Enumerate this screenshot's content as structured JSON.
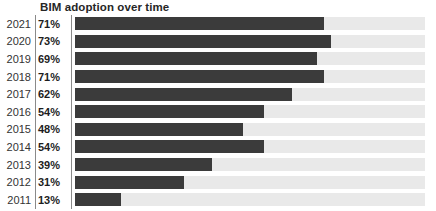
{
  "chart_data": {
    "type": "bar",
    "orientation": "horizontal",
    "title": "BIM adoption over time",
    "xlabel": "",
    "ylabel": "",
    "xlim": [
      0,
      100
    ],
    "unit": "%",
    "grid": false,
    "legend": false,
    "categories": [
      "2021",
      "2020",
      "2019",
      "2018",
      "2017",
      "2016",
      "2015",
      "2014",
      "2013",
      "2012",
      "2011"
    ],
    "values": [
      71,
      73,
      69,
      71,
      62,
      54,
      48,
      54,
      39,
      31,
      13
    ],
    "value_labels": [
      "71%",
      "73%",
      "69%",
      "71%",
      "62%",
      "54%",
      "48%",
      "54%",
      "39%",
      "31%",
      "13%"
    ],
    "colors": {
      "bar_fill": "#3b3b3b",
      "track_fill": "#e9e9e9",
      "title_text": "#262626",
      "category_text": "#333333",
      "value_text": "#1d1d1d",
      "separator": "#8a8a8a",
      "background": "#ffffff"
    },
    "rows": [
      {
        "category": "2021",
        "value": 71,
        "value_label": "71%"
      },
      {
        "category": "2020",
        "value": 73,
        "value_label": "73%"
      },
      {
        "category": "2019",
        "value": 69,
        "value_label": "69%"
      },
      {
        "category": "2018",
        "value": 71,
        "value_label": "71%"
      },
      {
        "category": "2017",
        "value": 62,
        "value_label": "62%"
      },
      {
        "category": "2016",
        "value": 54,
        "value_label": "54%"
      },
      {
        "category": "2015",
        "value": 48,
        "value_label": "48%"
      },
      {
        "category": "2014",
        "value": 54,
        "value_label": "54%"
      },
      {
        "category": "2013",
        "value": 39,
        "value_label": "39%"
      },
      {
        "category": "2012",
        "value": 31,
        "value_label": "31%"
      },
      {
        "category": "2011",
        "value": 13,
        "value_label": "13%"
      }
    ]
  }
}
